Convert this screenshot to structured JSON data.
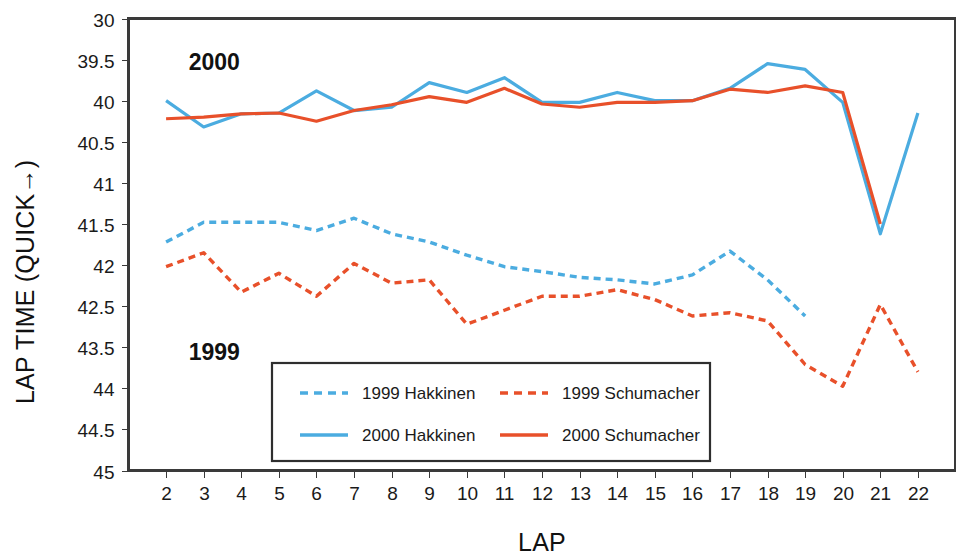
{
  "chart_data": {
    "type": "line",
    "title": "",
    "xlabel": "LAP",
    "ylabel": "LAP TIME (QUICK→)",
    "grid": true,
    "legend_position": "inside-bottom-center",
    "x": [
      2,
      3,
      4,
      5,
      6,
      7,
      8,
      9,
      10,
      11,
      12,
      13,
      14,
      15,
      16,
      17,
      18,
      19,
      20,
      21,
      22
    ],
    "xtick_labels": [
      "2",
      "3",
      "4",
      "5",
      "6",
      "7",
      "8",
      "9",
      "10",
      "11",
      "12",
      "13",
      "14",
      "15",
      "16",
      "17",
      "18",
      "19",
      "20",
      "21",
      "22"
    ],
    "ytick_labels": [
      "30",
      "39.5",
      "40",
      "40.5",
      "41",
      "41.5",
      "42",
      "42.5",
      "43.5",
      "44",
      "44.5",
      "45"
    ],
    "ytick_values": [
      39.0,
      39.5,
      40.0,
      40.5,
      41.0,
      41.5,
      42.0,
      42.5,
      43.0,
      44.0,
      44.5,
      45.0
    ],
    "ylim": [
      39.0,
      45.0
    ],
    "y_inverted": true,
    "annotations": [
      {
        "text": "2000",
        "x": 2.6,
        "y": 39.53
      },
      {
        "text": "1999",
        "x": 2.6,
        "y": 43.12
      }
    ],
    "series": [
      {
        "name": "1999 Hakkinen",
        "label": "1999 Hakkinen",
        "color": "#4BACE0",
        "style": "dashed",
        "values": [
          41.72,
          41.48,
          41.48,
          41.48,
          41.58,
          41.43,
          41.62,
          41.72,
          41.88,
          42.02,
          42.08,
          42.15,
          42.18,
          42.23,
          42.12,
          41.83,
          42.18,
          42.62,
          null,
          null,
          null
        ]
      },
      {
        "name": "1999 Schumacher",
        "label": "1999 Schumacher",
        "color": "#E8502A",
        "style": "dashed",
        "values": [
          42.02,
          41.85,
          42.33,
          42.1,
          42.38,
          41.98,
          42.22,
          42.18,
          42.72,
          42.55,
          42.38,
          42.38,
          42.3,
          42.42,
          42.62,
          42.58,
          42.68,
          43.42,
          43.95,
          42.48,
          43.6
        ]
      },
      {
        "name": "2000 Hakkinen",
        "label": "2000 Hakkinen",
        "color": "#4BACE0",
        "style": "solid",
        "values": [
          40.0,
          40.32,
          40.16,
          40.15,
          39.88,
          40.12,
          40.08,
          39.78,
          39.9,
          39.72,
          40.02,
          40.02,
          39.9,
          40.0,
          40.0,
          39.85,
          39.55,
          39.62,
          40.02,
          41.62,
          40.15
        ]
      },
      {
        "name": "2000 Schumacher",
        "label": "2000 Schumacher",
        "color": "#E8502A",
        "style": "solid",
        "values": [
          40.22,
          40.2,
          40.16,
          40.15,
          40.25,
          40.12,
          40.05,
          39.95,
          40.02,
          39.85,
          40.04,
          40.08,
          40.02,
          40.02,
          40.0,
          39.86,
          39.9,
          39.82,
          39.9,
          41.5,
          null
        ]
      }
    ]
  },
  "legend": {
    "entries": [
      {
        "label": "1999 Hakkinen"
      },
      {
        "label": "1999 Schumacher"
      },
      {
        "label": "2000 Hakkinen"
      },
      {
        "label": "2000 Schumacher"
      }
    ]
  },
  "axes": {
    "x_title": "LAP",
    "y_title": "LAP TIME (QUICK→)"
  },
  "colors": {
    "blue": "#4BACE0",
    "orange": "#E8502A",
    "grid": "#9a9a9a",
    "frame": "#3a3a3a",
    "text": "#1a1a1a",
    "background": "#ffffff"
  }
}
